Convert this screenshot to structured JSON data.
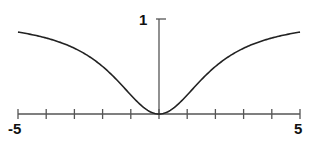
{
  "chart_data": {
    "type": "line",
    "title": "",
    "xlabel": "",
    "ylabel": "",
    "xlim": [
      -5,
      5
    ],
    "ylim": [
      0,
      1
    ],
    "grid": false,
    "legend": null,
    "x_tick_labels": [
      {
        "value": -5,
        "label": "-5"
      },
      {
        "value": 5,
        "label": "5"
      }
    ],
    "y_tick_labels": [
      {
        "value": 1,
        "label": "1"
      }
    ],
    "x_ticks": [
      -5,
      -4,
      -3,
      -2,
      -1,
      0,
      1,
      2,
      3,
      4,
      5
    ],
    "series": [
      {
        "name": "curve",
        "x": [
          -5,
          -4,
          -3,
          -2,
          -1.5,
          -1,
          -0.5,
          0,
          0.5,
          1,
          1.5,
          2,
          3,
          4,
          5
        ],
        "values": [
          0.86,
          0.8,
          0.69,
          0.5,
          0.36,
          0.2,
          0.06,
          0,
          0.06,
          0.2,
          0.36,
          0.5,
          0.69,
          0.8,
          0.86
        ]
      }
    ]
  },
  "labels": {
    "x_min": "-5",
    "x_max": "5",
    "y_max": "1"
  },
  "colors": {
    "curve": "#222222",
    "axis": "#555555"
  }
}
